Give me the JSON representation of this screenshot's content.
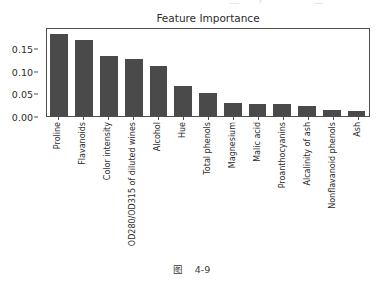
{
  "page": {
    "top_bleed_text": "一 一 丶 一 ＿ 一 ， 一 丶 一 ＿ 一 丶 一",
    "caption": "图    4-9"
  },
  "chart_data": {
    "type": "bar",
    "title": "Feature Importance",
    "xlabel": "",
    "ylabel": "",
    "grid": false,
    "legend": "none",
    "ylim": [
      0.0,
      0.196
    ],
    "yticks": [
      0.0,
      0.05,
      0.1,
      0.15
    ],
    "ytick_labels": [
      "0.00",
      "0.05",
      "0.10",
      "0.15"
    ],
    "categories": [
      "Proline",
      "Flavanoids",
      "Color intensity",
      "OD280/OD315 of diluted wines",
      "Alcohol",
      "Hue",
      "Total phenols",
      "Magnesium",
      "Malic acid",
      "Proanthocyanins",
      "Alcalinity of ash",
      "Nonflavanoid phenols",
      "Ash"
    ],
    "values": [
      0.185,
      0.172,
      0.136,
      0.128,
      0.112,
      0.067,
      0.051,
      0.03,
      0.028,
      0.027,
      0.023,
      0.013,
      0.011
    ],
    "bar_color": "#4a4a4a",
    "axis_color": "#4d4d4d"
  }
}
